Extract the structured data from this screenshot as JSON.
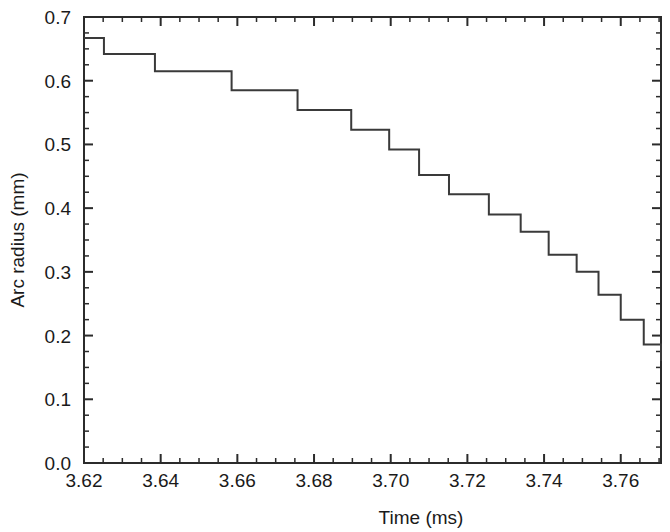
{
  "chart_data": {
    "type": "line",
    "title": "",
    "subtitle": "",
    "xlabel": "Time (ms)",
    "ylabel": "Arc radius (mm)",
    "xlim": [
      3.62,
      3.7705
    ],
    "ylim": [
      0.0,
      0.7
    ],
    "x_major_ticks": [
      3.62,
      3.64,
      3.66,
      3.68,
      3.7,
      3.72,
      3.74,
      3.76
    ],
    "x_major_tick_labels": [
      "3.62",
      "3.64",
      "3.66",
      "3.68",
      "3.70",
      "3.72",
      "3.74",
      "3.76"
    ],
    "x_minor_tick_step": 0.005,
    "y_major_ticks": [
      0.0,
      0.1,
      0.2,
      0.3,
      0.4,
      0.5,
      0.6,
      0.7
    ],
    "y_major_tick_labels": [
      "0.0",
      "0.1",
      "0.2",
      "0.3",
      "0.4",
      "0.5",
      "0.6",
      "0.7"
    ],
    "y_minor_tick_step": 0.025,
    "grid": false,
    "legend": null,
    "frame": "box",
    "tick_direction": "in",
    "line_color": "#3a3a3a",
    "line_width": 2,
    "drawstyle": "steps-post",
    "series": [
      {
        "name": "Arc radius",
        "x": [
          3.62,
          3.6252,
          3.6385,
          3.6585,
          3.6757,
          3.6897,
          3.6996,
          3.7074,
          3.7152,
          3.7256,
          3.7339,
          3.7412,
          3.7485,
          3.7542,
          3.76,
          3.766,
          3.7717,
          3.775,
          3.7705
        ],
        "values": [
          0.667,
          0.642,
          0.615,
          0.585,
          0.554,
          0.523,
          0.492,
          0.452,
          0.422,
          0.39,
          0.363,
          0.327,
          0.3,
          0.264,
          0.225,
          0.186,
          0.17,
          0.16,
          0.16
        ]
      }
    ],
    "steps": [
      {
        "x_start": 3.62,
        "x_end": 3.6252,
        "y": 0.667
      },
      {
        "x_start": 3.6252,
        "x_end": 3.6385,
        "y": 0.642
      },
      {
        "x_start": 3.6385,
        "x_end": 3.6585,
        "y": 0.615
      },
      {
        "x_start": 3.6585,
        "x_end": 3.6757,
        "y": 0.585
      },
      {
        "x_start": 3.6757,
        "x_end": 3.6897,
        "y": 0.554
      },
      {
        "x_start": 3.6897,
        "x_end": 3.6996,
        "y": 0.523
      },
      {
        "x_start": 3.6996,
        "x_end": 3.7074,
        "y": 0.492
      },
      {
        "x_start": 3.7074,
        "x_end": 3.7152,
        "y": 0.452
      },
      {
        "x_start": 3.7152,
        "x_end": 3.7256,
        "y": 0.422
      },
      {
        "x_start": 3.7256,
        "x_end": 3.7339,
        "y": 0.39
      },
      {
        "x_start": 3.7339,
        "x_end": 3.7412,
        "y": 0.363
      },
      {
        "x_start": 3.7412,
        "x_end": 3.7485,
        "y": 0.327
      },
      {
        "x_start": 3.7485,
        "x_end": 3.7542,
        "y": 0.3
      },
      {
        "x_start": 3.7542,
        "x_end": 3.76,
        "y": 0.264
      },
      {
        "x_start": 3.76,
        "x_end": 3.766,
        "y": 0.225
      },
      {
        "x_start": 3.766,
        "x_end": 3.7705,
        "y": 0.186
      },
      {
        "x_start": 3.7705,
        "x_end": 3.7705,
        "y": 0.16
      }
    ]
  }
}
